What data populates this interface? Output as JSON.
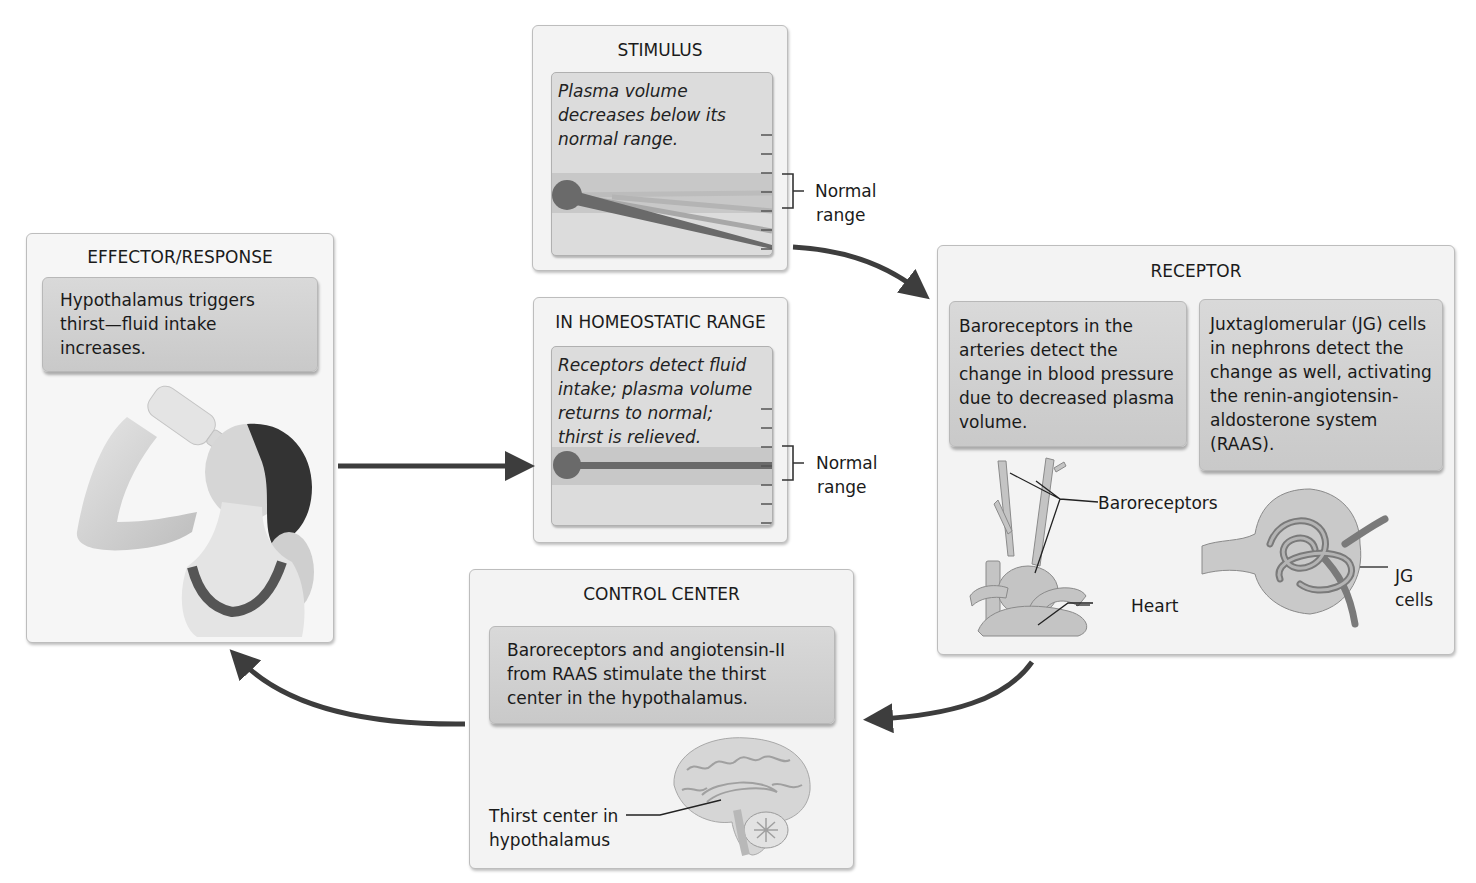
{
  "stimulus": {
    "title": "STIMULUS",
    "text_lines": [
      "Plasma volume",
      "decreases below its",
      "normal range."
    ],
    "range_label_lines": [
      "Normal",
      "range"
    ]
  },
  "homeostatic": {
    "title": "IN HOMEOSTATIC RANGE",
    "text_lines": [
      "Receptors detect fluid",
      "intake; plasma volume",
      "returns to normal;",
      "thirst is relieved."
    ],
    "range_label_lines": [
      "Normal",
      "range"
    ]
  },
  "receptor": {
    "title": "RECEPTOR",
    "left_note_lines": [
      "Baroreceptors in the",
      "arteries detect the",
      "change in blood pressure",
      "due to decreased plasma",
      "volume."
    ],
    "right_note_lines": [
      "Juxtaglomerular (JG) cells",
      "in nephrons detect the",
      "change as well, activating",
      "the renin-angiotensin-",
      "aldosterone system",
      "(RAAS)."
    ],
    "labels": {
      "baroreceptors": "Baroreceptors",
      "heart": "Heart",
      "jg_lines": [
        "JG",
        "cells"
      ]
    }
  },
  "control_center": {
    "title": "CONTROL CENTER",
    "note_lines": [
      "Baroreceptors and angiotensin-II",
      "from RAAS stimulate the thirst",
      "center in the hypothalamus."
    ],
    "label_lines": [
      "Thirst center in",
      "hypothalamus"
    ]
  },
  "effector": {
    "title": "EFFECTOR/RESPONSE",
    "note_lines": [
      "Hypothalamus triggers",
      "thirst—fluid intake",
      "increases."
    ]
  },
  "colors": {
    "arrow": "#3d3d3d",
    "card_bg": "#f3f3f3",
    "note_bg": "#d2d2d2",
    "gauge_band": "#c6c6c6",
    "gauge_line": "#6b6b6b"
  }
}
